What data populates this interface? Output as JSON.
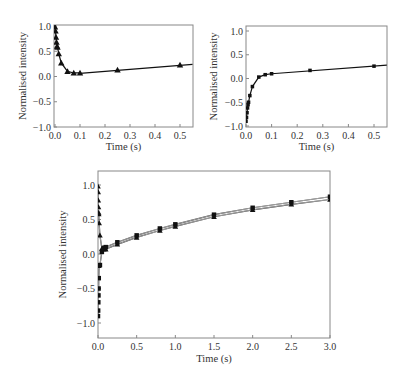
{
  "chart_data": [
    {
      "id": "top-left",
      "type": "line",
      "title": "",
      "xlabel": "Time (s)",
      "ylabel": "Normalised intensity",
      "xlim": [
        0.0,
        0.55
      ],
      "ylim": [
        -1.0,
        1.0
      ],
      "xticks": [
        "0.0",
        "0.1",
        "0.2",
        "0.3",
        "0.4",
        "0.5"
      ],
      "yticks": [
        "1.0",
        "0.5",
        "0.0",
        "−0.5",
        "−1.0"
      ],
      "grid": false,
      "series": [
        {
          "name": "triangles",
          "marker": "triangle",
          "x": [
            0.0,
            0.002,
            0.004,
            0.006,
            0.008,
            0.01,
            0.015,
            0.025,
            0.05,
            0.075,
            0.1,
            0.25,
            0.5
          ],
          "y": [
            0.98,
            0.9,
            0.78,
            0.68,
            0.6,
            0.58,
            0.45,
            0.27,
            0.1,
            0.07,
            0.07,
            0.13,
            0.23
          ]
        }
      ],
      "fit_line": {
        "x": [
          0.1,
          0.55
        ],
        "y": [
          0.06,
          0.24
        ]
      }
    },
    {
      "id": "top-right",
      "type": "line",
      "title": "",
      "xlabel": "Time (s)",
      "ylabel": "Normalised intensity",
      "xlim": [
        0.0,
        0.55
      ],
      "ylim": [
        -1.0,
        1.0
      ],
      "xticks": [
        "0.0",
        "0.1",
        "0.2",
        "0.3",
        "0.4",
        "0.5"
      ],
      "yticks": [
        "1.0",
        "0.5",
        "0.0",
        "−0.5",
        "−1.0"
      ],
      "grid": false,
      "series": [
        {
          "name": "squares",
          "marker": "square",
          "x": [
            0.0,
            0.002,
            0.004,
            0.006,
            0.008,
            0.01,
            0.015,
            0.025,
            0.05,
            0.075,
            0.1,
            0.25,
            0.5
          ],
          "y": [
            -0.9,
            -0.82,
            -0.72,
            -0.62,
            -0.55,
            -0.5,
            -0.36,
            -0.17,
            0.03,
            0.08,
            0.1,
            0.17,
            0.26
          ]
        }
      ],
      "fit_line": {
        "x": [
          0.1,
          0.55
        ],
        "y": [
          0.1,
          0.28
        ]
      }
    },
    {
      "id": "bottom",
      "type": "line",
      "title": "",
      "xlabel": "Time (s)",
      "ylabel": "Normalised intensity",
      "xlim": [
        0.0,
        3.0
      ],
      "ylim": [
        -1.2,
        1.2
      ],
      "xticks": [
        "0.0",
        "0.5",
        "1.0",
        "1.5",
        "2.0",
        "2.5",
        "3.0"
      ],
      "yticks": [
        "1.0",
        "0.5",
        "0.0",
        "−0.5",
        "−1.0"
      ],
      "grid": false,
      "series": [
        {
          "name": "triangles",
          "marker": "triangle",
          "x": [
            0.0,
            0.002,
            0.004,
            0.006,
            0.008,
            0.01,
            0.015,
            0.025,
            0.05,
            0.075,
            0.1,
            0.25,
            0.5,
            0.8,
            1.0,
            1.5,
            2.0,
            2.5,
            3.0
          ],
          "y": [
            0.98,
            0.9,
            0.78,
            0.68,
            0.6,
            0.58,
            0.45,
            0.27,
            0.08,
            0.07,
            0.07,
            0.14,
            0.24,
            0.34,
            0.4,
            0.54,
            0.64,
            0.72,
            0.79
          ]
        },
        {
          "name": "squares",
          "marker": "square",
          "x": [
            0.0,
            0.002,
            0.004,
            0.006,
            0.008,
            0.01,
            0.015,
            0.025,
            0.05,
            0.075,
            0.1,
            0.25,
            0.5,
            0.8,
            1.0,
            1.5,
            2.0,
            2.5,
            3.0
          ],
          "y": [
            -0.9,
            -0.82,
            -0.7,
            -0.6,
            -0.5,
            -0.35,
            -0.17,
            -0.16,
            0.03,
            0.09,
            0.1,
            0.17,
            0.27,
            0.37,
            0.43,
            0.57,
            0.67,
            0.75,
            0.83
          ]
        }
      ]
    }
  ]
}
